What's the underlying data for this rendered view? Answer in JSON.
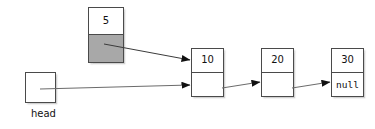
{
  "diagram": {
    "background_color": "#ffffff",
    "stroke_color": "#4a4a4a",
    "pointer_fill_color": "#a8a8a8",
    "head_pointer": {
      "label": "head",
      "box_value": ""
    },
    "new_node": {
      "value": "5",
      "pointer_text": ""
    },
    "nodes": [
      {
        "value": "10",
        "next_text": ""
      },
      {
        "value": "20",
        "next_text": ""
      },
      {
        "value": "30",
        "next_text": "null"
      }
    ],
    "arrows": [
      {
        "name": "new-node-to-first-node"
      },
      {
        "name": "head-to-first-node"
      },
      {
        "name": "node-10-to-node-20"
      },
      {
        "name": "node-20-to-node-30"
      }
    ]
  }
}
